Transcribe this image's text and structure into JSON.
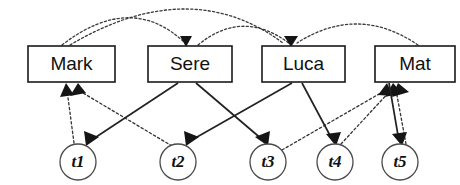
{
  "diagram": {
    "type": "path-diagram",
    "canvas": {
      "width": 460,
      "height": 185
    },
    "colors": {
      "background": "#ffffff",
      "box_stroke": "#1a1a1a",
      "circle_stroke": "#4a4a4a",
      "solid_edge": "#222222",
      "dashed_edge": "#333333",
      "arrow_fill": "#151515",
      "label_text": "#111111"
    },
    "boxes": [
      {
        "id": "mark",
        "label": "Mark",
        "x": 28,
        "y": 46,
        "w": 87,
        "h": 36
      },
      {
        "id": "sere",
        "label": "Sere",
        "x": 148,
        "y": 46,
        "w": 84,
        "h": 36
      },
      {
        "id": "luca",
        "label": "Luca",
        "x": 262,
        "y": 46,
        "w": 83,
        "h": 36
      },
      {
        "id": "mat",
        "label": "Mat",
        "x": 375,
        "y": 46,
        "w": 80,
        "h": 36
      }
    ],
    "circles": [
      {
        "id": "t1",
        "label": "t1",
        "cx": 78,
        "cy": 162,
        "r": 18
      },
      {
        "id": "t2",
        "label": "t2",
        "cx": 178,
        "cy": 162,
        "r": 18
      },
      {
        "id": "t3",
        "label": "t3",
        "cx": 268,
        "cy": 162,
        "r": 18
      },
      {
        "id": "t4",
        "label": "t4",
        "cx": 335,
        "cy": 162,
        "r": 18
      },
      {
        "id": "t5",
        "label": "t5",
        "cx": 400,
        "cy": 162,
        "r": 18
      }
    ],
    "solid_edges": [
      {
        "id": "sere-t1",
        "from": "sere",
        "to": "t1",
        "x1": 178,
        "y1": 83,
        "x2": 88,
        "y2": 143
      },
      {
        "id": "luca-t2",
        "from": "luca",
        "to": "t2",
        "x1": 290,
        "y1": 83,
        "x2": 188,
        "y2": 143
      },
      {
        "id": "sere-t3",
        "from": "sere",
        "to": "t3",
        "x1": 196,
        "y1": 83,
        "x2": 262,
        "y2": 143
      },
      {
        "id": "luca-t4",
        "from": "luca",
        "to": "t4",
        "x1": 300,
        "y1": 83,
        "x2": 332,
        "y2": 143
      },
      {
        "id": "mat-t5",
        "from": "mat",
        "to": "t5",
        "x1": 388,
        "y1": 83,
        "x2": 398,
        "y2": 143
      }
    ],
    "dashed_edges": [
      {
        "id": "t1-mark",
        "from": "t1",
        "to": "mark",
        "x1": 74,
        "y1": 143,
        "x2": 67,
        "y2": 85
      },
      {
        "id": "t2-mark",
        "from": "t2",
        "to": "mark",
        "x1": 172,
        "y1": 143,
        "x2": 76,
        "y2": 85
      },
      {
        "id": "t3-mat",
        "from": "t3",
        "to": "mat",
        "x1": 280,
        "y1": 148,
        "x2": 390,
        "y2": 85
      },
      {
        "id": "t4-mat",
        "from": "t4",
        "to": "mat",
        "x1": 340,
        "y1": 143,
        "x2": 394,
        "y2": 85
      },
      {
        "id": "t5-mat",
        "from": "t5",
        "to": "mat",
        "x1": 406,
        "y1": 143,
        "x2": 400,
        "y2": 85
      }
    ],
    "dashed_arcs": [
      {
        "id": "mark-sere",
        "from": "mark",
        "to": "sere",
        "x1": 62,
        "y1": 45,
        "cx": 132,
        "cy": 17,
        "x2": 186,
        "y2": 43
      },
      {
        "id": "mark-luca",
        "from": "mark",
        "to": "luca",
        "x1": 70,
        "y1": 45,
        "cx": 190,
        "cy": 2,
        "x2": 283,
        "y2": 42
      },
      {
        "id": "sere-luca",
        "from": "sere",
        "to": "luca",
        "x1": 198,
        "y1": 45,
        "cx": 243,
        "cy": 20,
        "x2": 290,
        "y2": 43
      },
      {
        "id": "mat-luca",
        "from": "mat",
        "to": "luca",
        "x1": 418,
        "y1": 45,
        "cx": 358,
        "cy": 18,
        "x2": 296,
        "y2": 42
      }
    ],
    "legend": {
      "solid_meaning": "solid arrow",
      "dashed_meaning": "dashed arrow"
    }
  }
}
